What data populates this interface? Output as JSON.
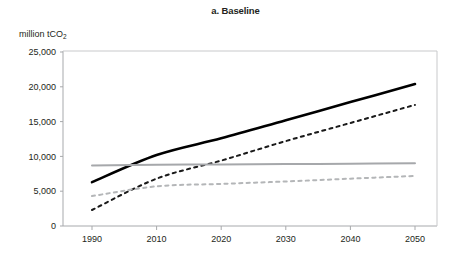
{
  "chart_data": {
    "type": "line",
    "title": "a. Baseline",
    "ylabel": "million tCO2",
    "ylabel_main": "million tCO",
    "ylabel_sub": "2",
    "xlabel": "",
    "x": [
      1990,
      2010,
      2020,
      2030,
      2040,
      2050
    ],
    "xlim": [
      1990,
      2050
    ],
    "ylim": [
      0,
      25000
    ],
    "xticks": [
      "1990",
      "2010",
      "2020",
      "2030",
      "2040",
      "2050"
    ],
    "yticks": [
      "0",
      "5,000",
      "10,000",
      "15,000",
      "20,000",
      "25,000"
    ],
    "ytick_values": [
      0,
      5000,
      10000,
      15000,
      20000,
      25000
    ],
    "grid": false,
    "legend": "none",
    "series": [
      {
        "name": "solid-black",
        "style": "solid",
        "color": "#000000",
        "width": 2.6,
        "values": [
          6300,
          10200,
          12600,
          15200,
          17800,
          20400
        ]
      },
      {
        "name": "dashed-black",
        "style": "dashed",
        "color": "#1a1a1a",
        "width": 2.0,
        "values": [
          2300,
          6800,
          9400,
          12200,
          14800,
          17400
        ]
      },
      {
        "name": "solid-gray",
        "style": "solid",
        "color": "#a6a8ab",
        "width": 2.0,
        "values": [
          8700,
          8800,
          8850,
          8900,
          8950,
          9000
        ]
      },
      {
        "name": "dashed-gray",
        "style": "dashed",
        "color": "#b4b6b8",
        "width": 2.0,
        "values": [
          4300,
          5700,
          6050,
          6400,
          6800,
          7200
        ]
      }
    ]
  }
}
